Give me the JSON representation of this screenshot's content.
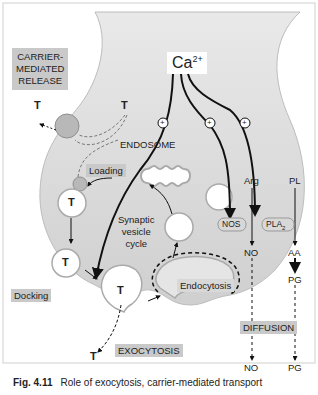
{
  "figure": {
    "labels": {
      "ca": "Ca",
      "ca_sup": "2+",
      "carrier_line1": "CARRIER-",
      "carrier_line2": "MEDIATED",
      "carrier_line3": "RELEASE",
      "loading": "Loading",
      "endosome": "ENDOSOME",
      "synaptic_line1": "Synaptic",
      "synaptic_line2": "vesicle",
      "synaptic_line3": "cycle",
      "docking": "Docking",
      "exocytosis": "EXOCYTOSIS",
      "endocytosis": "Endocytosis",
      "diffusion": "DIFFUSION",
      "nos": "NOS",
      "pla": "PLA",
      "pla_sub": "2",
      "arg": "Arg",
      "pl": "PL",
      "no_inside": "NO",
      "aa": "AA",
      "pg_inside": "PG",
      "no_outside": "NO",
      "pg_outside": "PG",
      "t": "T",
      "plus": "+"
    },
    "colors": {
      "terminal_fill": "#d2d2d2",
      "label_box": "#c9c9c9",
      "vesicle_fill": "#ffffff",
      "carrier_fill": "#b8b8b8",
      "line": "#111111"
    }
  },
  "caption": {
    "number": "Fig. 4.11",
    "text": "Role of exocytosis, carrier-mediated transport"
  }
}
